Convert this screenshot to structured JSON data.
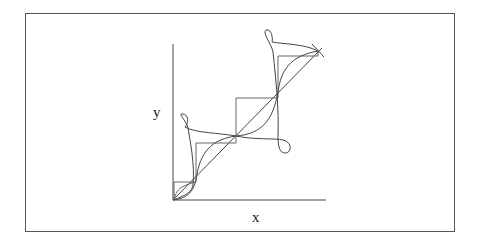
{
  "figure": {
    "labels": {
      "x_axis": "x",
      "y_axis": "y"
    },
    "colors": {
      "stroke": "#444444",
      "frame": "#555555",
      "background": "#ffffff"
    },
    "elements": [
      "staircase-function",
      "diagonal-line-y-equals-x",
      "smooth-s-curve-approximation",
      "looped-parametric-curve",
      "cross-marker-at-endpoint"
    ]
  }
}
